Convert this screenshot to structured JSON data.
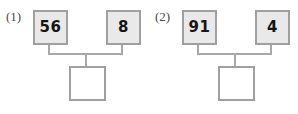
{
  "worksheet": {
    "type": "number-bond-addition-worksheet",
    "problems": [
      {
        "label": "(1)",
        "addend_a": "56",
        "addend_b": "8",
        "sum": "",
        "sum_box_state": "empty"
      },
      {
        "label": "(2)",
        "addend_a": "91",
        "addend_b": "4",
        "sum": "",
        "sum_box_state": "empty"
      }
    ]
  },
  "style": {
    "box_fill_filled": "#e9e9e9",
    "box_fill_empty": "#ffffff",
    "box_border": "#a0a0a0",
    "connector": "#a8a8a8",
    "number_color": "#161616",
    "label_color": "#4a4a4a",
    "page_background": "#ffffff"
  }
}
